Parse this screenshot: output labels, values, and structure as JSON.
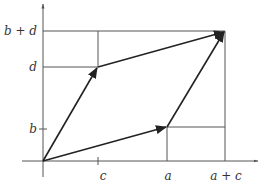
{
  "diagram": {
    "axes": {
      "x_ticks": [
        {
          "label": "c",
          "x": 98
        },
        {
          "label": "a",
          "x": 167
        },
        {
          "label": "a + c",
          "x": 225
        }
      ],
      "y_ticks": [
        {
          "label": "b",
          "y": 129
        },
        {
          "label": "d",
          "y": 67
        },
        {
          "label": "b + d",
          "y": 31
        }
      ]
    },
    "labels": {
      "x_c": "c",
      "x_a": "a",
      "x_ac": "a + c",
      "y_b": "b",
      "y_d": "d",
      "y_bd": "b + d"
    },
    "points": {
      "origin": [
        43,
        161
      ],
      "cd": [
        98,
        67
      ],
      "ab": [
        167,
        127
      ],
      "sum": [
        225,
        31
      ]
    },
    "colors": {
      "vector": "#222222",
      "axis": "#555555"
    }
  }
}
